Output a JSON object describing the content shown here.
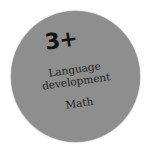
{
  "badge": {
    "age_label": "3+",
    "topics": [
      "Language",
      "development",
      "Math"
    ],
    "colors": {
      "background": "#8e8e8e",
      "text": "#1e1e1e",
      "page": "#ffffff"
    }
  }
}
